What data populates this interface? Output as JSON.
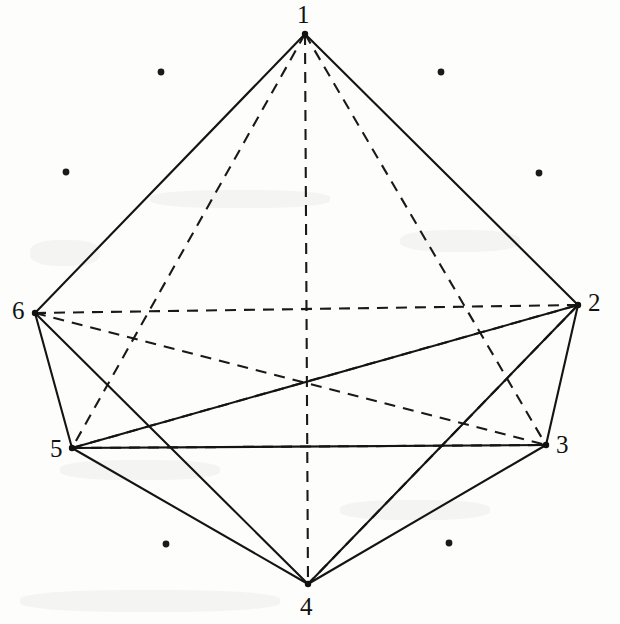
{
  "figure": {
    "width": 620,
    "height": 624,
    "background_color": "#fdfdfc",
    "line_color": "#141414",
    "label_color": "#111111"
  },
  "chart_data": {
    "type": "diagram",
    "vertices": [
      {
        "label": "1",
        "x": 305,
        "y": 34,
        "label_x": 297,
        "label_y": 2,
        "position": "top"
      },
      {
        "label": "2",
        "x": 578,
        "y": 305,
        "label_x": 588,
        "label_y": 290,
        "position": "right"
      },
      {
        "label": "3",
        "x": 546,
        "y": 445,
        "label_x": 556,
        "label_y": 432,
        "position": "lower-right"
      },
      {
        "label": "4",
        "x": 308,
        "y": 584,
        "label_x": 300,
        "label_y": 594,
        "position": "bottom"
      },
      {
        "label": "5",
        "x": 72,
        "y": 448,
        "label_x": 50,
        "label_y": 436,
        "position": "lower-left"
      },
      {
        "label": "6",
        "x": 35,
        "y": 313,
        "label_x": 12,
        "label_y": 298,
        "position": "left"
      }
    ],
    "edges_solid": [
      {
        "from": "1",
        "to": "6"
      },
      {
        "from": "1",
        "to": "2"
      },
      {
        "from": "6",
        "to": "5"
      },
      {
        "from": "6",
        "to": "4"
      },
      {
        "from": "5",
        "to": "4"
      },
      {
        "from": "5",
        "to": "2"
      },
      {
        "from": "4",
        "to": "3"
      },
      {
        "from": "4",
        "to": "2"
      },
      {
        "from": "2",
        "to": "3"
      },
      {
        "from": "3",
        "to": "5"
      }
    ],
    "edges_dashed": [
      {
        "from": "1",
        "to": "4"
      },
      {
        "from": "1",
        "to": "3"
      },
      {
        "from": "1",
        "to": "5"
      },
      {
        "from": "6",
        "to": "2"
      },
      {
        "from": "6",
        "to": "3"
      },
      {
        "from": "5",
        "to": "2"
      },
      {
        "from": "5",
        "to": "3"
      },
      {
        "from": "2",
        "to": "4"
      }
    ],
    "background_dots": [
      {
        "x": 161,
        "y": 72
      },
      {
        "x": 441,
        "y": 72
      },
      {
        "x": 66,
        "y": 172
      },
      {
        "x": 539,
        "y": 173
      },
      {
        "x": 166,
        "y": 544
      },
      {
        "x": 449,
        "y": 543
      }
    ]
  }
}
